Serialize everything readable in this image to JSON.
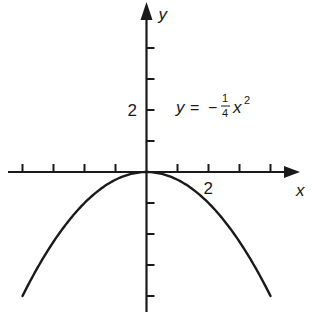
{
  "chart_data": {
    "type": "line",
    "title": "",
    "xlabel": "x",
    "ylabel": "y",
    "equation_label": {
      "lhs": "y",
      "eq": "=",
      "sign": "−",
      "numerator": "1",
      "denominator": "4",
      "var": "x",
      "exponent": "2"
    },
    "function": "y = -x^2/4",
    "xlim": [
      -4.7,
      5.1
    ],
    "ylim": [
      -4.4,
      5.5
    ],
    "x_ticks": [
      -4,
      -3,
      -2,
      -1,
      1,
      2,
      3,
      4
    ],
    "y_ticks": [
      -4,
      -3,
      -2,
      -1,
      1,
      2,
      3,
      4
    ],
    "x_tick_labels": [
      {
        "value": 2,
        "label": "2"
      }
    ],
    "y_tick_labels": [
      {
        "value": 2,
        "label": "2"
      }
    ],
    "series": [
      {
        "name": "y = -1/4 x^2",
        "x": [
          -4,
          -3,
          -2,
          -1,
          0,
          1,
          2,
          3,
          4
        ],
        "y": [
          -4,
          -2.25,
          -1,
          -0.25,
          0,
          -0.25,
          -1,
          -2.25,
          -4
        ]
      }
    ],
    "grid": false,
    "legend": "none",
    "colors": {
      "axis": "#1a1a1a",
      "curve": "#1a1a1a",
      "background": "#ffffff"
    }
  }
}
